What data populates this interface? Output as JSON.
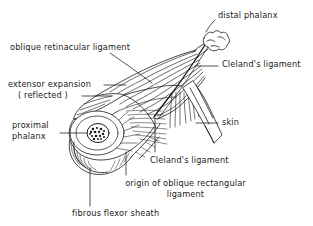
{
  "figure": {
    "type": "anatomical-line-drawing",
    "ink_color": "#1a1a1a",
    "background_color": "#ffffff"
  },
  "labels": {
    "distal_phalanx": "distal phalanx",
    "oblique_retinacular_ligament": "oblique retinacular ligament",
    "clelands_ligament_upper": "Cleland's ligament",
    "extensor_expansion": "extensor expansion",
    "extensor_expansion_reflected": "( reflected )",
    "proximal_phalanx_line1": "proximal",
    "proximal_phalanx_line2": "phalanx",
    "skin": "skin",
    "clelands_ligament_lower": "Cleland's ligament",
    "origin_oblique_line1": "origin of oblique rectangular",
    "origin_oblique_line2": "ligament",
    "fibrous_flexor_sheath": "fibrous flexor sheath"
  }
}
